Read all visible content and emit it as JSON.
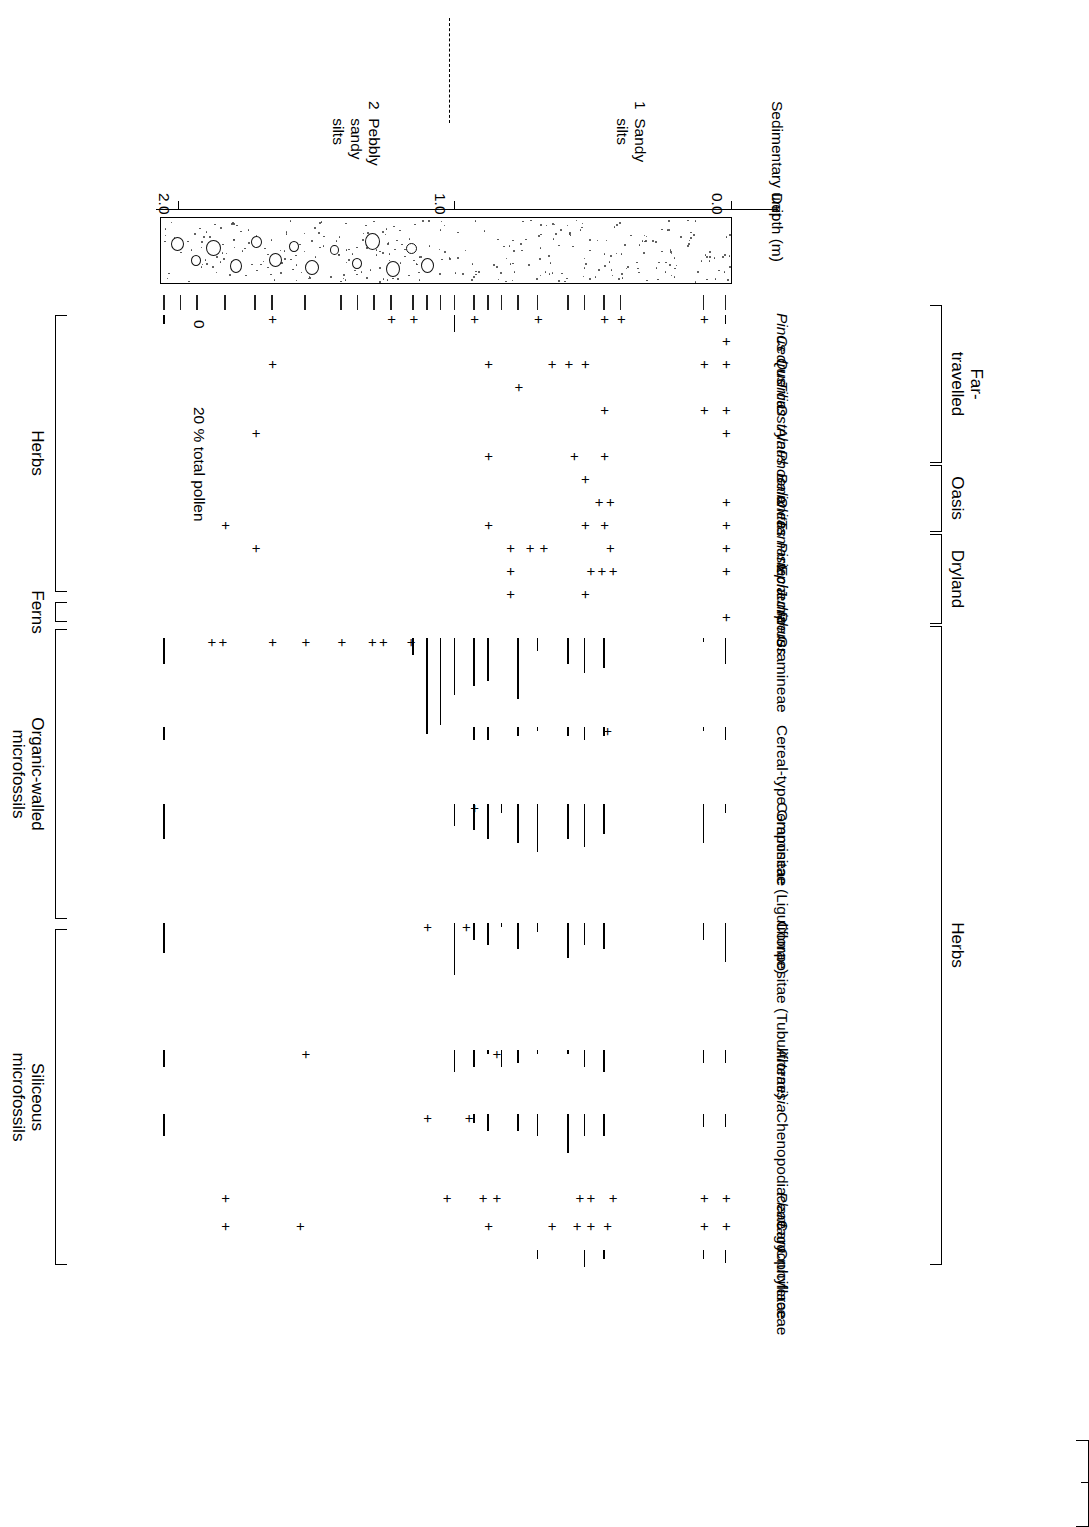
{
  "figure": {
    "type": "pollen-percentage-diagram",
    "orientation_note": "printed upside-down (rotated 180 degrees)"
  },
  "axes": {
    "depth_axis_title": "Depth (m)",
    "depth_ticks": [
      "0.0",
      "1.0",
      "2.0"
    ],
    "depth_tick_values": [
      0.0,
      1.0,
      2.0
    ],
    "sed_axis_title": "Sedimentary unit",
    "scale_zero_label": "0",
    "scale_value_label": "20 % total pollen",
    "scale_percent": 20
  },
  "sedimentary_units": [
    {
      "number": "1",
      "name_line1": "Sandy",
      "name_line2": "silts"
    },
    {
      "number": "2",
      "name_line1": "Pebbly",
      "name_line2": "sandy",
      "name_line3": "silts"
    }
  ],
  "left_groups": [
    {
      "label": "Far-\ntravelled"
    },
    {
      "label": "Oasis"
    },
    {
      "label": "Dryland"
    },
    {
      "label": "Herbs"
    }
  ],
  "right_groups": [
    {
      "label": "Herbs"
    },
    {
      "label": "Ferns"
    },
    {
      "label": "Organic-walled\nmicrofossils"
    },
    {
      "label": "Siliceous\nmicrofossils"
    }
  ],
  "taxa": [
    {
      "name": "Pinus",
      "italic": true
    },
    {
      "name": "Cedrus",
      "italic": true
    },
    {
      "name": "Quercus",
      "italic": true
    },
    {
      "name": "Tilia",
      "italic": true
    },
    {
      "name": "Ostrya",
      "italic": true
    },
    {
      "name": "Alnus",
      "italic": true
    },
    {
      "name": "Phoenix",
      "italic": true
    },
    {
      "name": "Balanites",
      "italic": true
    },
    {
      "name": "Olea",
      "italic": true
    },
    {
      "name": "Tamarix",
      "italic": true
    },
    {
      "name": "Pistacia",
      "italic": true
    },
    {
      "name": "Ephedra",
      "italic": true
    },
    {
      "name": "Juniperus",
      "italic": true
    },
    {
      "name": "Rhus",
      "italic": true
    },
    {
      "name": "Gramineae",
      "italic": false
    },
    {
      "name": "Cereal-type Gramineae",
      "italic": false
    },
    {
      "name": "Compositae (Liguliflorae)",
      "italic": false
    },
    {
      "name": "Compositae (Tubuliflorae)",
      "italic": false
    },
    {
      "name": "Artemisia",
      "italic": true
    },
    {
      "name": "Chenopodiaceae",
      "italic": false
    },
    {
      "name": "Plantago",
      "italic": true
    },
    {
      "name": "Caryophyllaceae",
      "italic": false
    },
    {
      "name": "Cruciferae",
      "italic": false
    }
  ],
  "chart_data": {
    "type": "bar",
    "xlabel": "Depth (m)",
    "ylabel": "% total pollen",
    "xlim": [
      0.0,
      2.1
    ],
    "grid": false,
    "legend": "none",
    "plus_marker_meaning": "present, below 1 %",
    "sample_depths": [
      0.02,
      0.1,
      0.4,
      0.46,
      0.53,
      0.59,
      0.7,
      0.77,
      0.83,
      0.88,
      0.93,
      1.0,
      1.05,
      1.1,
      1.15,
      1.23,
      1.29,
      1.35,
      1.41,
      1.54,
      1.66,
      1.72,
      1.83,
      1.93,
      1.99,
      2.05
    ],
    "series": [
      {
        "name": "Pinus",
        "values": [
          2,
          0,
          0,
          0,
          0,
          0,
          0,
          0,
          0,
          0,
          0,
          4,
          0,
          0,
          0,
          0,
          0,
          0,
          0,
          0,
          0,
          0,
          0,
          0,
          0,
          2
        ],
        "plus_at": [
          0.1,
          0.4,
          0.46,
          0.7,
          0.93,
          1.15,
          1.23,
          1.66
        ]
      },
      {
        "name": "Cedrus",
        "values": [],
        "plus_at": [
          0.02
        ]
      },
      {
        "name": "Quercus",
        "values": [],
        "plus_at": [
          0.02,
          0.1,
          0.53,
          0.59,
          0.65,
          0.88,
          1.66
        ]
      },
      {
        "name": "Tilia",
        "values": [],
        "plus_at": [
          0.77
        ]
      },
      {
        "name": "Ostrya",
        "values": [],
        "plus_at": [
          0.02,
          0.1,
          0.46
        ]
      },
      {
        "name": "Alnus",
        "values": [],
        "plus_at": [
          0.02,
          1.72
        ]
      },
      {
        "name": "Phoenix",
        "values": [],
        "plus_at": [
          0.46,
          0.57,
          0.88
        ]
      },
      {
        "name": "Balanites",
        "values": [],
        "plus_at": [
          0.53
        ]
      },
      {
        "name": "Olea",
        "values": [],
        "plus_at": [
          0.02,
          0.44,
          0.48
        ]
      },
      {
        "name": "Tamarix",
        "values": [],
        "plus_at": [
          0.02,
          0.46,
          0.53,
          0.88,
          1.83
        ]
      },
      {
        "name": "Pistacia",
        "values": [],
        "plus_at": [
          0.02,
          0.44,
          0.68,
          0.73,
          0.8,
          1.72
        ]
      },
      {
        "name": "Ephedra",
        "values": [],
        "plus_at": [
          0.02,
          0.43,
          0.47,
          0.51,
          0.8
        ]
      },
      {
        "name": "Juniperus",
        "values": [],
        "plus_at": [
          0.53,
          0.8
        ]
      },
      {
        "name": "Rhus",
        "values": [],
        "plus_at": [
          0.02
        ]
      },
      {
        "name": "Gramineae",
        "values": [
          6,
          1,
          0,
          7,
          8,
          6,
          3,
          14,
          0,
          10,
          11,
          13,
          20,
          22,
          4,
          0,
          0,
          0,
          0,
          0,
          0,
          0,
          0,
          0,
          0,
          6
        ],
        "plus_at": [
          1.16,
          1.26,
          1.3,
          1.41,
          1.54,
          1.66,
          1.84,
          1.88
        ]
      },
      {
        "name": "Cereal-type Gramineae",
        "values": [
          3,
          1,
          0,
          2,
          3,
          2,
          1,
          2,
          0,
          3,
          3,
          0,
          0,
          0,
          0,
          0,
          0,
          0,
          0,
          0,
          0,
          0,
          0,
          0,
          0,
          3
        ],
        "plus_at": [
          0.45
        ]
      },
      {
        "name": "Compositae (Liguliflorae)",
        "values": [
          2,
          9,
          0,
          7,
          10,
          8,
          11,
          9,
          2,
          8,
          6,
          5,
          0,
          0,
          0,
          0,
          0,
          0,
          0,
          0,
          0,
          0,
          0,
          0,
          0,
          8
        ],
        "plus_at": [
          0.93
        ]
      },
      {
        "name": "Compositae (Tubuliflorae)",
        "values": [
          9,
          4,
          0,
          6,
          5,
          8,
          2,
          6,
          1,
          5,
          4,
          12,
          0,
          0,
          0,
          0,
          0,
          0,
          0,
          0,
          0,
          0,
          0,
          0,
          0,
          7
        ],
        "plus_at": [
          0.96,
          1.1
        ]
      },
      {
        "name": "Artemisia",
        "values": [
          3,
          3,
          0,
          5,
          4,
          1,
          1,
          3,
          4,
          1,
          4,
          5,
          0,
          0,
          0,
          0,
          0,
          0,
          0,
          0,
          0,
          0,
          0,
          0,
          0,
          4
        ],
        "plus_at": [
          0.85,
          1.54
        ]
      },
      {
        "name": "Chenopodiaceae",
        "values": [
          3,
          3,
          0,
          5,
          5,
          9,
          5,
          4,
          0,
          4,
          2,
          0,
          0,
          0,
          0,
          0,
          0,
          0,
          0,
          0,
          0,
          0,
          0,
          0,
          0,
          5
        ],
        "plus_at": [
          0.95,
          1.1
        ]
      },
      {
        "name": "Plantago",
        "values": [],
        "plus_at": [
          0.02,
          0.1,
          0.43,
          0.51,
          0.55,
          0.85,
          0.9,
          1.03,
          1.83
        ]
      },
      {
        "name": "Caryophyllaceae",
        "values": [],
        "plus_at": [
          0.02,
          0.1,
          0.45,
          0.51,
          0.56,
          0.65,
          0.88,
          1.56,
          1.83
        ]
      },
      {
        "name": "Cruciferae",
        "values": [
          3,
          2,
          0,
          2,
          4,
          0,
          2,
          0,
          0,
          0,
          0,
          0,
          0,
          0,
          0,
          0,
          0,
          0,
          0,
          0,
          0,
          0,
          0,
          0,
          0,
          0
        ],
        "plus_at": []
      }
    ]
  }
}
